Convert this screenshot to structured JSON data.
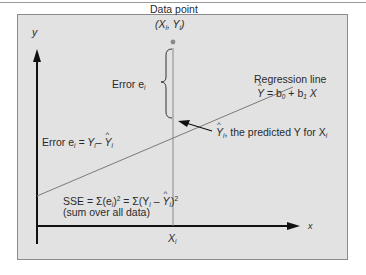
{
  "diagram": {
    "axes": {
      "y_label": "y",
      "x_label": "x",
      "x_tick": "X",
      "x_tick_sub": "i"
    },
    "data_point": {
      "label": "Data point",
      "coords_open": "(X",
      "coords_sub1": "i",
      "coords_mid": ", Y",
      "coords_sub2": "i",
      "coords_close": ")"
    },
    "error_brace": {
      "label": "Error e",
      "label_sub": "i"
    },
    "regression_line": {
      "title": "Regression line",
      "eq_lhs": "Y",
      "eq_mid": " = b",
      "eq_sub0": "0",
      "eq_plus": " + b",
      "eq_sub1": "1",
      "eq_x": " X"
    },
    "predicted": {
      "symbol": "Y",
      "symbol_sub": "i",
      "text": ", the predicted Y for X",
      "text_sub": "i"
    },
    "error_formula": {
      "prefix": "Error e",
      "sub": "i",
      "eq": "= Y",
      "sub2": "i",
      "minus": "– ",
      "yhat": "Y",
      "sub3": "i"
    },
    "sse": {
      "line1_a": "SSE = Σ(e",
      "line1_sub": "i",
      "line1_b": ")",
      "line1_sup": "2",
      "line1_c": " = Σ(Y",
      "line1_sub2": "i",
      "line1_d": " – ",
      "line1_yhat": "Y",
      "line1_sub3": "i",
      "line1_e": ")",
      "line1_sup2": "2",
      "line2": "(sum over all data)"
    },
    "colors": {
      "panel_bg": "#e2e2e2",
      "axis": "#111111",
      "line": "#7a7a7a",
      "point": "#8a8a8a"
    }
  }
}
